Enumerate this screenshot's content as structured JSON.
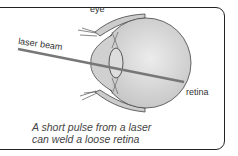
{
  "diagram": {
    "labels": {
      "eye": "eye",
      "laser_beam": "laser beam",
      "retina": "retina"
    },
    "caption": {
      "line1": "A short pulse from a laser",
      "line2": "can weld a loose retina"
    },
    "colors": {
      "border": "#222222",
      "eye_fill": "#d6d6d6",
      "beam": "#777777"
    }
  }
}
